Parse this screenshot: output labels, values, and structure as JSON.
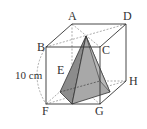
{
  "diagram": {
    "type": "cube-with-pyramid",
    "vertices": {
      "A": "A",
      "B": "B",
      "C": "C",
      "D": "D",
      "E": "E",
      "F": "F",
      "G": "G",
      "H": "H"
    },
    "dimension_label": "10 cm",
    "colors": {
      "pyramid_fill": "#a8a8a8",
      "pyramid_dark": "#8c8c8c",
      "edge": "#333333",
      "hidden": "#888888"
    }
  }
}
